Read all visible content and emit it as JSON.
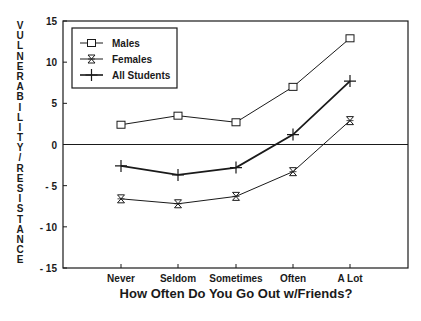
{
  "chart_data": {
    "type": "line",
    "title": "",
    "xlabel": "How Often Do You Go Out w/Friends?",
    "ylabel": "VULNERABILITY/RESISTANCE",
    "categories": [
      "Never",
      "Seldom",
      "Sometimes",
      "Often",
      "A Lot"
    ],
    "ylim": [
      -15,
      15
    ],
    "yticks": [
      15,
      10,
      5,
      0,
      -5,
      -10,
      -15
    ],
    "grid": false,
    "reference_line": 0,
    "legend_position": "upper left (inside)",
    "series": [
      {
        "name": "Males",
        "marker": "square",
        "line_weight": "thin",
        "values": [
          2.4,
          3.5,
          2.7,
          7.0,
          12.9
        ]
      },
      {
        "name": "Females",
        "marker": "hourglass",
        "line_weight": "thin",
        "values": [
          -6.6,
          -7.2,
          -6.3,
          -3.3,
          2.9
        ]
      },
      {
        "name": "All Students",
        "marker": "plus",
        "line_weight": "thick",
        "values": [
          -2.6,
          -3.7,
          -2.8,
          1.2,
          7.7
        ]
      }
    ]
  },
  "colors": {
    "ink": "#1a1a1a",
    "background": "#ffffff"
  }
}
